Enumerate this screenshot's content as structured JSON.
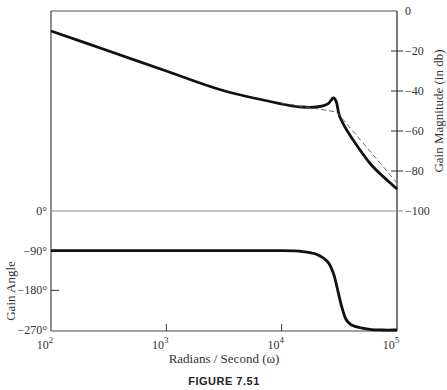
{
  "chart_data": [
    {
      "type": "line",
      "panel": "magnitude",
      "xscale": "log",
      "xlim": [
        100,
        100000
      ],
      "ylim": [
        -100,
        0
      ],
      "ylabel": "Gain Magnitude  (in db)",
      "yticks": [
        0,
        -20,
        -40,
        -60,
        -80,
        -100
      ],
      "ytick_labels": [
        "0",
        "−20",
        "−40",
        "−60",
        "−80",
        "−100"
      ],
      "yaxis_side": "right",
      "series": [
        {
          "name": "actual",
          "style": "solid",
          "x": [
            100,
            300,
            1000,
            3000,
            10000,
            15000,
            20000,
            25000,
            28000,
            30000,
            32000,
            40000,
            60000,
            100000
          ],
          "y": [
            -10,
            -19.5,
            -30,
            -39.5,
            -46.5,
            -48,
            -48,
            -46.5,
            -43.5,
            -46,
            -53,
            -63,
            -77,
            -89
          ]
        },
        {
          "name": "asymptote",
          "style": "dashed",
          "x": [
            10000,
            30000,
            100000
          ],
          "y": [
            -46,
            -50.5,
            -86
          ]
        }
      ]
    },
    {
      "type": "line",
      "panel": "phase",
      "xscale": "log",
      "xlim": [
        100,
        100000
      ],
      "ylim": [
        -270,
        0
      ],
      "ylabel": "Gain Angle",
      "yticks": [
        0,
        -90,
        -180,
        -270
      ],
      "ytick_labels": [
        "0°",
        "−90°",
        "−180°",
        "−270°"
      ],
      "yaxis_side": "left",
      "series": [
        {
          "name": "phase",
          "style": "solid",
          "x": [
            100,
            1000,
            10000,
            15000,
            20000,
            25000,
            28000,
            30000,
            33000,
            36000,
            40000,
            50000,
            60000,
            75000,
            100000
          ],
          "y": [
            -90,
            -90,
            -90,
            -92,
            -98,
            -115,
            -140,
            -170,
            -215,
            -245,
            -258,
            -266,
            -269,
            -270,
            -270
          ]
        }
      ]
    }
  ],
  "xaxis": {
    "ticks": [
      100,
      1000,
      10000,
      100000
    ],
    "tick_bases": [
      "10",
      "10",
      "10",
      "10"
    ],
    "tick_exps": [
      "2",
      "3",
      "4",
      "5"
    ],
    "label": "Radians / Second  (ω)"
  },
  "caption": "FIGURE 7.51"
}
